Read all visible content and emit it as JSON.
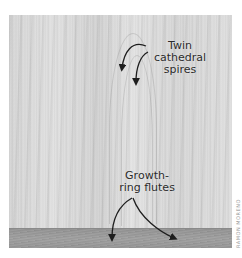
{
  "image": {
    "description": "Photo of flatsawn wood grain with annotated features; end-grain board at the bottom",
    "annotations": [
      {
        "id": "spires",
        "text_lines": [
          "Twin",
          "cathedral",
          "spires"
        ]
      },
      {
        "id": "flutes",
        "text_lines": [
          "Growth-",
          "ring flutes"
        ]
      }
    ],
    "credit": "RAMON MORENO",
    "colors": {
      "background": "#ffffff",
      "wood_face": "#dcdcdc",
      "end_grain": "#a0a0a0",
      "label_text": "#2b2b2b",
      "arrow": "#1e1e1e"
    }
  }
}
